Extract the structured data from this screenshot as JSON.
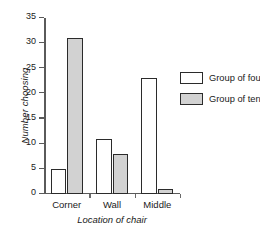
{
  "chart_data": {
    "type": "bar",
    "title": "",
    "subtitle": "",
    "categories": [
      "Corner",
      "Wall",
      "Middle"
    ],
    "series": [
      {
        "name": "Group of four",
        "values": [
          5,
          11,
          23
        ],
        "color": "#ffffff"
      },
      {
        "name": "Group of ten",
        "values": [
          31,
          8,
          1
        ],
        "color": "#d2d2d2"
      }
    ],
    "xlabel": "Location of chair",
    "ylabel": "Number choosing",
    "ylim": [
      0,
      35
    ],
    "ytick_labels": [
      "0",
      "5",
      "10",
      "15",
      "20",
      "25",
      "30",
      "35"
    ],
    "ytick_values": [
      0,
      5,
      10,
      15,
      20,
      25,
      30,
      35
    ],
    "grid": false,
    "legend_position": "right",
    "bar_edge_color": "#2b2b2b",
    "axis_color": "#5a5a5a"
  }
}
